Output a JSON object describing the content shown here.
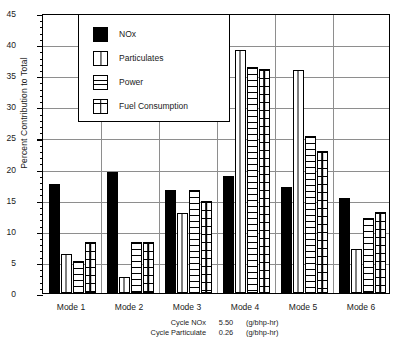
{
  "chart_data": {
    "type": "bar",
    "title": "",
    "xlabel": "",
    "ylabel": "Percent Contribution to Total",
    "ylim": [
      0,
      45
    ],
    "ytick_step": 5,
    "yticks": [
      0,
      5,
      10,
      15,
      20,
      25,
      30,
      35,
      40,
      45
    ],
    "grid": true,
    "legend_position": "top-center",
    "categories": [
      "Mode 1",
      "Mode 2",
      "Mode 3",
      "Mode 4",
      "Mode 5",
      "Mode 6"
    ],
    "series": [
      {
        "name": "NOx",
        "pattern": "solid-black",
        "values": [
          17.5,
          19.5,
          16.6,
          18.8,
          17.0,
          15.2
        ]
      },
      {
        "name": "Particulates",
        "pattern": "vertical-split",
        "values": [
          6.2,
          2.5,
          12.8,
          39.0,
          35.8,
          7.0
        ]
      },
      {
        "name": "Power",
        "pattern": "horizontal-lines",
        "values": [
          5.2,
          8.2,
          16.5,
          36.3,
          25.2,
          12.0
        ]
      },
      {
        "name": "Fuel Consumption",
        "pattern": "grid-cross",
        "values": [
          8.2,
          8.2,
          14.8,
          36.0,
          22.8,
          13.1
        ]
      }
    ],
    "annotations": [
      {
        "label": "Cycle NOx",
        "value": "5.50",
        "unit": "(g/bhp-hr)"
      },
      {
        "label": "Cycle Particulate",
        "value": "0.26",
        "unit": "(g/bhp-hr)"
      }
    ]
  },
  "colors": {
    "ink": "#000000",
    "grid": "#8e8e8e",
    "background": "#ffffff"
  }
}
